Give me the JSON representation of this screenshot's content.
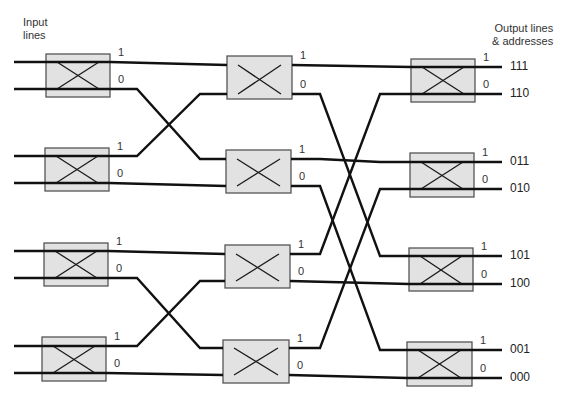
{
  "title_left": [
    "Input",
    "lines"
  ],
  "title_right": [
    "Output lines",
    "& addresses"
  ],
  "colors": {
    "line": "#111111",
    "box_fill": "#e2e2e2",
    "box_stroke": "#555555",
    "cross": "#1a1a1a"
  },
  "port_labels": {
    "upper": "1",
    "lower": "0"
  },
  "output_addresses": [
    "111",
    "110",
    "011",
    "010",
    "101",
    "100",
    "001",
    "000"
  ],
  "switches": [
    {
      "col": 1,
      "x": 46,
      "y": 54,
      "w": 64,
      "h": 43,
      "top": 62,
      "bot": 89
    },
    {
      "col": 1,
      "x": 45,
      "y": 148,
      "w": 64,
      "h": 43,
      "top": 156,
      "bot": 183
    },
    {
      "col": 1,
      "x": 44,
      "y": 243,
      "w": 64,
      "h": 43,
      "top": 251,
      "bot": 278
    },
    {
      "col": 1,
      "x": 42,
      "y": 337,
      "w": 64,
      "h": 44,
      "top": 346,
      "bot": 373
    },
    {
      "col": 2,
      "x": 227,
      "y": 56,
      "w": 65,
      "h": 43,
      "top": 65,
      "bot": 94
    },
    {
      "col": 2,
      "x": 226,
      "y": 150,
      "w": 65,
      "h": 43,
      "top": 159,
      "bot": 186
    },
    {
      "col": 2,
      "x": 225,
      "y": 245,
      "w": 65,
      "h": 43,
      "top": 254,
      "bot": 281
    },
    {
      "col": 2,
      "x": 223,
      "y": 340,
      "w": 66,
      "h": 43,
      "top": 348,
      "bot": 375
    },
    {
      "col": 3,
      "x": 411,
      "y": 59,
      "w": 64,
      "h": 43,
      "top": 67,
      "bot": 94
    },
    {
      "col": 3,
      "x": 410,
      "y": 153,
      "w": 64,
      "h": 44,
      "top": 162,
      "bot": 189
    },
    {
      "col": 3,
      "x": 409,
      "y": 248,
      "w": 64,
      "h": 43,
      "top": 256,
      "bot": 284
    },
    {
      "col": 3,
      "x": 407,
      "y": 342,
      "w": 65,
      "h": 44,
      "top": 350,
      "bot": 378
    }
  ]
}
